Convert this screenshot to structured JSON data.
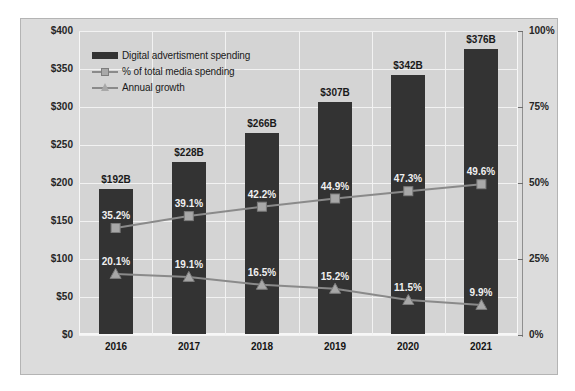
{
  "chart_data": {
    "type": "bar",
    "title": "",
    "categories": [
      "2016",
      "2017",
      "2018",
      "2019",
      "2020",
      "2021"
    ],
    "xlabel": "",
    "ylabel": "",
    "ylim": [
      0,
      400
    ],
    "y2lim": [
      0,
      100
    ],
    "grid": true,
    "legend_position": "inside-top-left",
    "left_axis_ticks": [
      "$400",
      "$350",
      "$300",
      "$250",
      "$200",
      "$150",
      "$100",
      "$50",
      "$0"
    ],
    "left_axis_values": [
      400,
      350,
      300,
      250,
      200,
      150,
      100,
      50,
      0
    ],
    "right_axis_ticks": [
      "100%",
      "75%",
      "50%",
      "25%",
      "0%"
    ],
    "right_axis_values": [
      100,
      75,
      50,
      25,
      0
    ],
    "series": [
      {
        "name": "Digital advertisment spending",
        "type": "bar",
        "axis": "left",
        "color": "#333333",
        "values": [
          192,
          228,
          266,
          307,
          342,
          376
        ],
        "labels": [
          "$192B",
          "$228B",
          "$266B",
          "$307B",
          "$342B",
          "$376B"
        ]
      },
      {
        "name": "% of total media spending",
        "type": "line",
        "axis": "right",
        "marker": "square",
        "color": "#8a8a8a",
        "values": [
          35.2,
          39.1,
          42.2,
          44.9,
          47.3,
          49.6
        ],
        "labels": [
          "35.2%",
          "39.1%",
          "42.2%",
          "44.9%",
          "47.3%",
          "49.6%"
        ]
      },
      {
        "name": "Annual growth",
        "type": "line",
        "axis": "right",
        "marker": "triangle",
        "color": "#8a8a8a",
        "values": [
          20.1,
          19.1,
          16.5,
          15.2,
          11.5,
          9.9
        ],
        "labels": [
          "20.1%",
          "19.1%",
          "16.5%",
          "15.2%",
          "11.5%",
          "9.9%"
        ]
      }
    ]
  },
  "legend": {
    "items": [
      {
        "label": "Digital advertisment spending",
        "marker": "bar-swatch"
      },
      {
        "label": "% of total media spending",
        "marker": "line-square-marker"
      },
      {
        "label": "Annual growth",
        "marker": "line-triangle-marker"
      }
    ]
  },
  "colors": {
    "bar": "#333333",
    "line": "#8a8a8a",
    "marker": "#a8a8a8",
    "plot_background": "#d4d4d4",
    "frame_background": "#dcdcdc",
    "gridline": "#f2f2f2"
  }
}
